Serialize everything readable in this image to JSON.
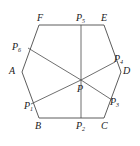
{
  "figure": {
    "type": "geometry-diagram",
    "shape": "hexagon",
    "stroke_color": "#4a4a4a",
    "text_color": "#1a1a1a",
    "background_color": "#ffffff",
    "caption": "",
    "vertices": [
      {
        "id": "A",
        "label": "A",
        "x": 22,
        "y": 72,
        "label_x": 9,
        "label_y": 66
      },
      {
        "id": "B",
        "label": "B",
        "x": 39,
        "y": 118,
        "label_x": 35,
        "label_y": 121
      },
      {
        "id": "C",
        "label": "C",
        "x": 104,
        "y": 118,
        "label_x": 101,
        "label_y": 121
      },
      {
        "id": "D",
        "label": "D",
        "x": 121,
        "y": 72,
        "label_x": 123,
        "label_y": 66
      },
      {
        "id": "E",
        "label": "E",
        "x": 104,
        "y": 25,
        "label_x": 101,
        "label_y": 13
      },
      {
        "id": "F",
        "label": "F",
        "x": 39,
        "y": 25,
        "label_x": 37,
        "label_y": 13
      }
    ],
    "side_points": [
      {
        "id": "P1",
        "label": "P",
        "sub": "1",
        "x": 31,
        "y": 104,
        "label_x": 24,
        "label_y": 101
      },
      {
        "id": "P2",
        "label": "P",
        "sub": "2",
        "x": 81,
        "y": 118,
        "label_x": 76,
        "label_y": 121
      },
      {
        "id": "P3",
        "label": "P",
        "sub": "3",
        "x": 112,
        "y": 100,
        "label_x": 110,
        "label_y": 97
      },
      {
        "id": "P4",
        "label": "P",
        "sub": "4",
        "x": 115,
        "y": 62,
        "label_x": 114,
        "label_y": 54
      },
      {
        "id": "P5",
        "label": "P",
        "sub": "5",
        "x": 81,
        "y": 25,
        "label_x": 76,
        "label_y": 13
      },
      {
        "id": "P6",
        "label": "P",
        "sub": "6",
        "x": 28,
        "y": 48,
        "label_x": 12,
        "label_y": 42
      }
    ],
    "center_point": {
      "id": "P",
      "label": "P",
      "x": 81,
      "y": 80,
      "label_x": 77,
      "label_y": 84
    },
    "edges": [
      {
        "from": "A",
        "to": "B"
      },
      {
        "from": "B",
        "to": "C"
      },
      {
        "from": "C",
        "to": "D"
      },
      {
        "from": "D",
        "to": "E"
      },
      {
        "from": "E",
        "to": "F"
      },
      {
        "from": "F",
        "to": "A"
      }
    ],
    "cevians": [
      {
        "from": "P",
        "to": "P1"
      },
      {
        "from": "P",
        "to": "P2"
      },
      {
        "from": "P",
        "to": "P3"
      },
      {
        "from": "P",
        "to": "P4"
      },
      {
        "from": "P",
        "to": "P5"
      },
      {
        "from": "P",
        "to": "P6"
      }
    ]
  }
}
